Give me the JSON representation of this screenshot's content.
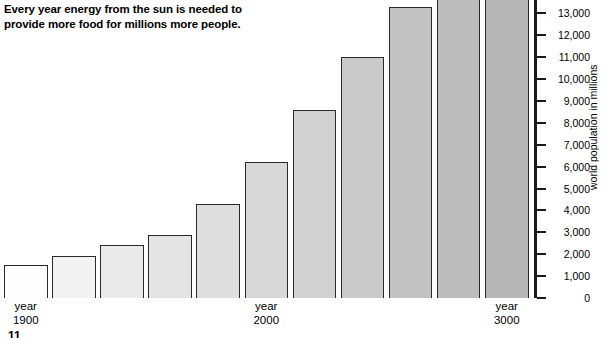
{
  "caption": {
    "lines": [
      "Every year energy from the sun is needed to",
      "provide more food for millions more people."
    ]
  },
  "page_number": "11",
  "colors": {
    "bar_border": "#2a2a2a",
    "axis": "#1a1a1a",
    "text": "#000000",
    "background": "#ffffff"
  },
  "chart_data": {
    "type": "bar",
    "title": "",
    "xlabel": "",
    "ylabel": "world population in millions",
    "ylim": [
      0,
      13500
    ],
    "grid": false,
    "legend": null,
    "y_ticks": [
      "0",
      "1,000",
      "2,000",
      "3,000",
      "4,000",
      "5,000",
      "6,000",
      "7,000",
      "8,000",
      "9,000",
      "10,000",
      "11,000",
      "12,000",
      "13,000"
    ],
    "categories": [
      "year 1900",
      "",
      "",
      "",
      "",
      "year 2000",
      "",
      "",
      "",
      "",
      "year 3000"
    ],
    "x_axis_labels": [
      {
        "bar_index": 0,
        "line1": "year",
        "line2": "1900"
      },
      {
        "bar_index": 5,
        "line1": "year",
        "line2": "2000"
      },
      {
        "bar_index": 10,
        "line1": "year",
        "line2": "3000"
      }
    ],
    "values": [
      1500,
      1900,
      2400,
      2900,
      4300,
      6200,
      8600,
      11000,
      13300,
      14600,
      15300
    ],
    "bar_shades": [
      "#fdfdfd",
      "#f2f2f2",
      "#eaeaea",
      "#e4e4e4",
      "#dedede",
      "#d8d8d8",
      "#d2d2d2",
      "#cacaca",
      "#c2c2c2",
      "#bcbcbc",
      "#b6b6b6"
    ]
  }
}
